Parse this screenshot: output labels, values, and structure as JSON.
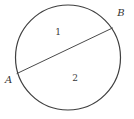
{
  "diagram": {
    "type": "circle-with-chord",
    "points": [
      {
        "label": "A",
        "position": "left edge of circle, outside"
      },
      {
        "label": "B",
        "position": "upper-right edge of circle, outside"
      }
    ],
    "regions": [
      {
        "label": "1",
        "position": "inside circle, above chord AB"
      },
      {
        "label": "2",
        "position": "inside circle, below chord AB"
      }
    ],
    "colors": {
      "stroke": "#3f3f3f",
      "text": "#333333",
      "background": "#ffffff"
    }
  }
}
